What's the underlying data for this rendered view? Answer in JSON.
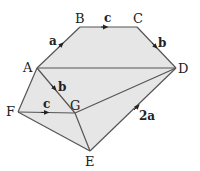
{
  "diagram": {
    "fill_color": "#e6e6e6",
    "line_color": "#555555",
    "vertices": {
      "A": {
        "label": "A",
        "x": 37,
        "y": 68
      },
      "B": {
        "label": "B",
        "x": 80,
        "y": 27
      },
      "C": {
        "label": "C",
        "x": 137,
        "y": 27
      },
      "D": {
        "label": "D",
        "x": 176,
        "y": 68
      },
      "E": {
        "label": "E",
        "x": 90,
        "y": 151
      },
      "F": {
        "label": "F",
        "x": 18,
        "y": 112
      },
      "G": {
        "label": "G",
        "x": 75,
        "y": 113
      }
    },
    "vector_labels": {
      "AB": "a",
      "BC": "c",
      "CD": "b",
      "AG": "b",
      "FG": "c",
      "ED": "2a"
    }
  }
}
